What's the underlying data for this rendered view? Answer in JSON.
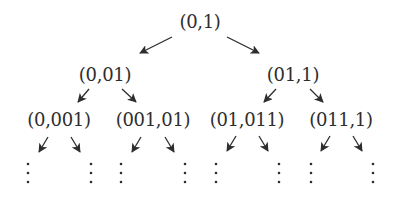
{
  "diagram": {
    "type": "binary-tree",
    "nodes": [
      {
        "id": "n0",
        "label": "(0,1)",
        "x": 200,
        "y": 21
      },
      {
        "id": "n1",
        "label": "(0,01)",
        "x": 105,
        "y": 74
      },
      {
        "id": "n2",
        "label": "(01,1)",
        "x": 293,
        "y": 74
      },
      {
        "id": "n3",
        "label": "(0,001)",
        "x": 59,
        "y": 119
      },
      {
        "id": "n4",
        "label": "(001,01)",
        "x": 153,
        "y": 119
      },
      {
        "id": "n5",
        "label": "(01,011)",
        "x": 247,
        "y": 119
      },
      {
        "id": "n6",
        "label": "(011,1)",
        "x": 341,
        "y": 119
      }
    ],
    "edges": [
      {
        "from": "n0",
        "to": "n1",
        "x1": 172,
        "y1": 37,
        "x2": 140,
        "y2": 53
      },
      {
        "from": "n0",
        "to": "n2",
        "x1": 227,
        "y1": 37,
        "x2": 259,
        "y2": 53
      },
      {
        "from": "n1",
        "to": "n3",
        "x1": 89,
        "y1": 89,
        "x2": 78,
        "y2": 102
      },
      {
        "from": "n1",
        "to": "n4",
        "x1": 122,
        "y1": 89,
        "x2": 136,
        "y2": 102
      },
      {
        "from": "n2",
        "to": "n5",
        "x1": 276,
        "y1": 89,
        "x2": 264,
        "y2": 102
      },
      {
        "from": "n2",
        "to": "n6",
        "x1": 310,
        "y1": 89,
        "x2": 323,
        "y2": 102
      },
      {
        "from": "n3",
        "to": "c0",
        "x1": 48,
        "y1": 137,
        "x2": 39,
        "y2": 152
      },
      {
        "from": "n3",
        "to": "c1",
        "x1": 71,
        "y1": 137,
        "x2": 80,
        "y2": 152
      },
      {
        "from": "n4",
        "to": "c2",
        "x1": 141,
        "y1": 137,
        "x2": 132,
        "y2": 152
      },
      {
        "from": "n4",
        "to": "c3",
        "x1": 165,
        "y1": 137,
        "x2": 174,
        "y2": 152
      },
      {
        "from": "n5",
        "to": "c4",
        "x1": 236,
        "y1": 136,
        "x2": 227,
        "y2": 151
      },
      {
        "from": "n5",
        "to": "c5",
        "x1": 259,
        "y1": 136,
        "x2": 268,
        "y2": 151
      },
      {
        "from": "n6",
        "to": "c6",
        "x1": 330,
        "y1": 136,
        "x2": 321,
        "y2": 151
      },
      {
        "from": "n6",
        "to": "c7",
        "x1": 353,
        "y1": 136,
        "x2": 362,
        "y2": 151
      }
    ],
    "continuation": {
      "symbol": "vertical-ellipsis",
      "columns_x": [
        28,
        91,
        121,
        185,
        216,
        279,
        311,
        373
      ],
      "dot_y": [
        164,
        173,
        182
      ]
    },
    "colors": {
      "ink": "#2e2e2e",
      "background": "#ffffff"
    }
  }
}
